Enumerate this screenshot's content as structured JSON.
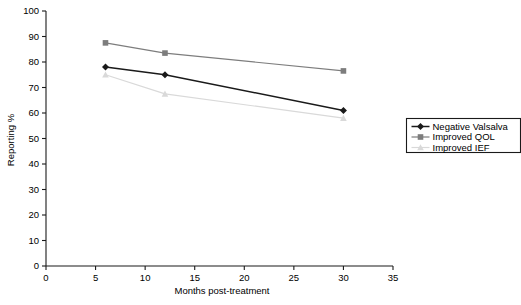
{
  "chart_data": {
    "type": "line",
    "title": "",
    "xlabel": "Months post-treatment",
    "ylabel": "Reporting %",
    "xlim": [
      0,
      35
    ],
    "ylim": [
      0,
      100
    ],
    "xticks": [
      0,
      5,
      10,
      15,
      20,
      25,
      30,
      35
    ],
    "yticks": [
      0,
      10,
      20,
      30,
      40,
      50,
      60,
      70,
      80,
      90,
      100
    ],
    "xtick_labels": [
      "0",
      "5",
      "10",
      "15",
      "20",
      "25",
      "30",
      "35"
    ],
    "ytick_labels": [
      "0",
      "10",
      "20",
      "30",
      "40",
      "50",
      "60",
      "70",
      "80",
      "90",
      "100"
    ],
    "grid": false,
    "legend_position": "right",
    "x": [
      6,
      12,
      30
    ],
    "series": [
      {
        "name": "Negative Valsalva",
        "values": [
          78,
          75,
          61
        ],
        "color": "#1a1a1a",
        "marker": "diamond"
      },
      {
        "name": "Improved QOL",
        "values": [
          87.5,
          83.5,
          76.5
        ],
        "color": "#7d7d7d",
        "marker": "square"
      },
      {
        "name": "Improved IEF",
        "values": [
          75,
          67.5,
          58
        ],
        "color": "#d9d9d9",
        "marker": "triangle"
      }
    ]
  },
  "legend": {
    "entries": [
      {
        "label": "Negative Valsalva"
      },
      {
        "label": "Improved QOL"
      },
      {
        "label": "Improved IEF"
      }
    ]
  },
  "axes": {
    "x_title": "Months post-treatment",
    "y_title": "Reporting %"
  }
}
